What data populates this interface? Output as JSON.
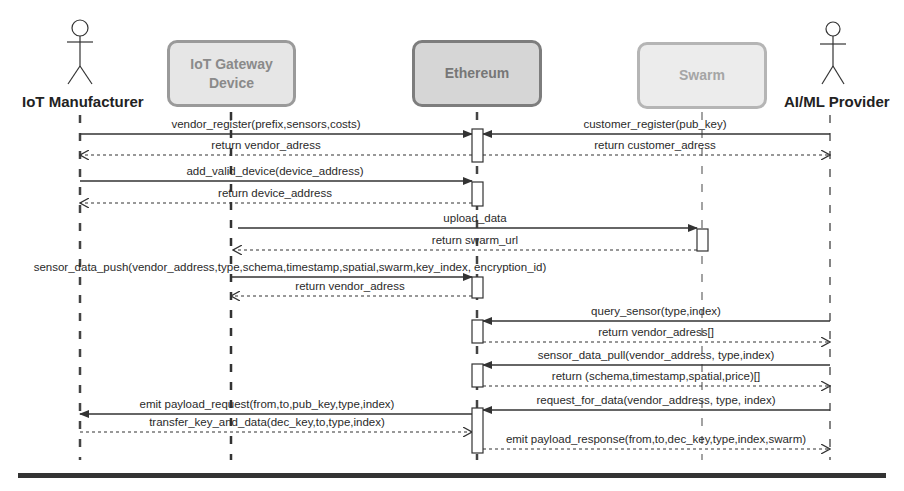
{
  "participants": [
    {
      "id": "manufacturer",
      "label": "IoT Manufacturer",
      "kind": "actor",
      "x": 80
    },
    {
      "id": "gateway",
      "label_line1": "IoT Gateway",
      "label_line2": "Device",
      "kind": "box",
      "x": 231
    },
    {
      "id": "ethereum",
      "label": "Ethereum",
      "kind": "box",
      "x": 477
    },
    {
      "id": "swarm",
      "label": "Swarm",
      "kind": "box",
      "x": 702
    },
    {
      "id": "aiml",
      "label": "AI/ML Provider",
      "kind": "actor",
      "x": 830
    }
  ],
  "messages": [
    {
      "label": "vendor_register(prefix,sensors,costs)",
      "from": 80,
      "to": 472,
      "y": 134,
      "style": "solid",
      "label_x": 266
    },
    {
      "label": "customer_register(pub_key)",
      "from": 830,
      "to": 483,
      "y": 134,
      "style": "solid",
      "label_x": 655
    },
    {
      "label": "return vendor_adress",
      "from": 472,
      "to": 80,
      "y": 155,
      "style": "dashed",
      "label_x": 266
    },
    {
      "label": "return customer_adress",
      "from": 483,
      "to": 830,
      "y": 155,
      "style": "dashed",
      "label_x": 655
    },
    {
      "label": "add_valid_device(device_address)",
      "from": 80,
      "to": 472,
      "y": 181,
      "style": "solid",
      "label_x": 275
    },
    {
      "label": "return device_address",
      "from": 472,
      "to": 80,
      "y": 203,
      "style": "dashed",
      "label_x": 275
    },
    {
      "label": "upload_data",
      "from": 238,
      "to": 697,
      "y": 228,
      "style": "solid",
      "label_x": 475
    },
    {
      "label": "return swarm_url",
      "from": 697,
      "to": 233,
      "y": 250,
      "style": "dashed",
      "label_x": 475
    },
    {
      "label": "sensor_data_push(vendor_address,type,schema,timestamp,spatial,swarm,key_index, encryption_id)",
      "from": 231,
      "to": 472,
      "y": 277,
      "style": "solid",
      "label_x": 290
    },
    {
      "label": "return vendor_adress",
      "from": 472,
      "to": 231,
      "y": 296,
      "style": "dashed",
      "label_x": 350
    },
    {
      "label": "query_sensor(type,index)",
      "from": 830,
      "to": 483,
      "y": 321,
      "style": "solid",
      "label_x": 656
    },
    {
      "label": "return vendor_adress[]",
      "from": 483,
      "to": 830,
      "y": 342,
      "style": "dashed",
      "label_x": 656
    },
    {
      "label": "sensor_data_pull(vendor_address, type,index)",
      "from": 830,
      "to": 483,
      "y": 365,
      "style": "solid",
      "label_x": 656
    },
    {
      "label": "return (schema,timestamp,spatial,price)[]",
      "from": 483,
      "to": 830,
      "y": 386,
      "style": "dashed",
      "label_x": 656
    },
    {
      "label": "request_for_data(vendor_address, type, index)",
      "from": 830,
      "to": 483,
      "y": 410,
      "style": "solid",
      "label_x": 656
    },
    {
      "label": "emit payload_request(from,to,pub_key,type,index)",
      "from": 472,
      "to": 80,
      "y": 414,
      "style": "solid",
      "label_x": 267
    },
    {
      "label": "transfer_key_and_data(dec_key,to,type,index)",
      "from": 80,
      "to": 472,
      "y": 432,
      "style": "dashed",
      "label_x": 267
    },
    {
      "label": "emit payload_response(from,to,dec_key,type,index,swarm)",
      "from": 483,
      "to": 830,
      "y": 449,
      "style": "dashed",
      "label_x": 656
    }
  ],
  "activations": [
    {
      "x": 472,
      "y": 129,
      "h": 33
    },
    {
      "x": 472,
      "y": 182,
      "h": 24
    },
    {
      "x": 697,
      "y": 229,
      "h": 22
    },
    {
      "x": 472,
      "y": 277,
      "h": 21
    },
    {
      "x": 472,
      "y": 320,
      "h": 23
    },
    {
      "x": 472,
      "y": 364,
      "h": 23
    },
    {
      "x": 472,
      "y": 408,
      "h": 45
    }
  ],
  "colors": {
    "line": "#333333",
    "box_border": "#9a9a9a",
    "box_fill": "#e6e6e6"
  }
}
